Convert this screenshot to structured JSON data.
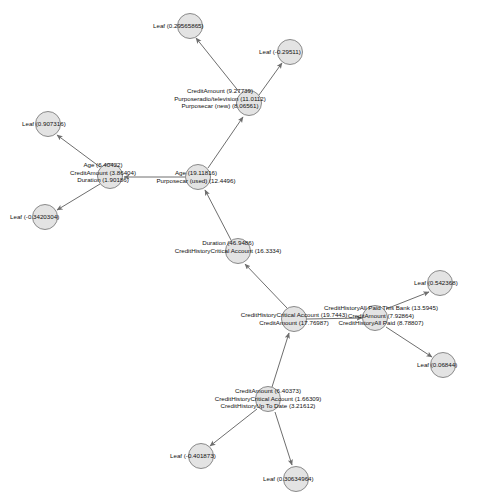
{
  "graph": {
    "type": "decision-tree-graph",
    "background_color": "#ffffff",
    "node_fill_color": "#e3e3e3",
    "node_stroke_color": "#8a8a8a",
    "edge_color": "#6e6e6e",
    "nodes": [
      {
        "id": "leaf_top_left",
        "kind": "leaf",
        "cx": 190,
        "cy": 26,
        "r": 13,
        "label_lines": [
          "Leaf (0.29565865)"
        ],
        "label_anchor": "left",
        "label_x": 153,
        "label_y": 22
      },
      {
        "id": "leaf_top_right",
        "kind": "leaf",
        "cx": 290,
        "cy": 52,
        "r": 13,
        "label_lines": [
          "Leaf (-0.29511)"
        ],
        "label_anchor": "left",
        "label_x": 259,
        "label_y": 48
      },
      {
        "id": "split_credit_amount_927",
        "kind": "split",
        "cx": 249,
        "cy": 103,
        "r": 13,
        "label_lines": [
          "CreditAmount (9.27739)",
          "Purposeradio/television (11.0112)",
          "Purposecar (new) (8.06561)"
        ],
        "label_anchor": "center",
        "label_x": 220,
        "label_y": 87
      },
      {
        "id": "leaf_left_upper",
        "kind": "leaf",
        "cx": 48,
        "cy": 124,
        "r": 13,
        "label_lines": [
          "Leaf (0.907316)"
        ],
        "label_anchor": "left",
        "label_x": 22,
        "label_y": 120
      },
      {
        "id": "split_age_640",
        "kind": "split",
        "cx": 110,
        "cy": 176,
        "r": 13,
        "label_lines": [
          "Age (6.40422)",
          "CreditAmount (3.86404)",
          "Duration (1.90186)"
        ],
        "label_anchor": "center",
        "label_x": 103,
        "label_y": 161
      },
      {
        "id": "split_age_1911",
        "kind": "split",
        "cx": 198,
        "cy": 177,
        "r": 13,
        "label_lines": [
          "Age (19.11816)",
          "Purposecar (used) (12.4496)"
        ],
        "label_anchor": "center",
        "label_x": 196,
        "label_y": 169
      },
      {
        "id": "leaf_left_lower",
        "kind": "leaf",
        "cx": 45,
        "cy": 217,
        "r": 13,
        "label_lines": [
          "Leaf (-0.3420304)"
        ],
        "label_anchor": "left",
        "label_x": 10,
        "label_y": 213
      },
      {
        "id": "split_duration_469",
        "kind": "split",
        "cx": 238,
        "cy": 251,
        "r": 13,
        "label_lines": [
          "Duration (46.9486)",
          "CreditHistoryCritical Account (16.3334)"
        ],
        "label_anchor": "center",
        "label_x": 228,
        "label_y": 239
      },
      {
        "id": "leaf_right_upper",
        "kind": "leaf",
        "cx": 440,
        "cy": 283,
        "r": 13,
        "label_lines": [
          "Leaf (0.542368)"
        ],
        "label_anchor": "left",
        "label_x": 414,
        "label_y": 279
      },
      {
        "id": "split_credit_history_1974",
        "kind": "split",
        "cx": 294,
        "cy": 319,
        "r": 13,
        "label_lines": [
          "CreditHistoryCritical Account (19.7443)",
          "CreditAmount (17.76987)"
        ],
        "label_anchor": "center",
        "label_x": 294,
        "label_y": 311
      },
      {
        "id": "split_credit_history_all_paid",
        "kind": "split",
        "cx": 375,
        "cy": 318,
        "r": 13,
        "label_lines": [
          "CreditHistoryAll Paid This Bank (13.5945)",
          "CreditAmount (7.92864)",
          "CreditHistoryAll Paid (8.78807)"
        ],
        "label_anchor": "center",
        "label_x": 381,
        "label_y": 304
      },
      {
        "id": "leaf_right_lower",
        "kind": "leaf",
        "cx": 443,
        "cy": 365,
        "r": 13,
        "label_lines": [
          "Leaf (0.06844)"
        ],
        "label_anchor": "left",
        "label_x": 417,
        "label_y": 361
      },
      {
        "id": "split_credit_amount_640",
        "kind": "split",
        "cx": 268,
        "cy": 399,
        "r": 13,
        "label_lines": [
          "CreditAmount (6.40373)",
          "CreditHistoryCritical Account (1.66309)",
          "CreditHistoryUp To Date (3.21612)"
        ],
        "label_anchor": "center",
        "label_x": 268,
        "label_y": 387
      },
      {
        "id": "leaf_bottom_left",
        "kind": "leaf",
        "cx": 201,
        "cy": 456,
        "r": 13,
        "label_lines": [
          "Leaf (-0.401873)"
        ],
        "label_anchor": "left",
        "label_x": 170,
        "label_y": 452
      },
      {
        "id": "leaf_bottom_right",
        "kind": "leaf",
        "cx": 296,
        "cy": 479,
        "r": 13,
        "label_lines": [
          "Leaf (0.30634964)"
        ],
        "label_anchor": "left",
        "label_x": 263,
        "label_y": 475
      }
    ],
    "edges": [
      {
        "id": "edge-split927-to-leaftopleft",
        "from": "split_credit_amount_927",
        "to": "leaf_top_left",
        "x1": 240,
        "y1": 93,
        "x2": 196,
        "y2": 38
      },
      {
        "id": "edge-split927-to-leaftopright",
        "from": "split_credit_amount_927",
        "to": "leaf_top_right",
        "x1": 259,
        "y1": 95,
        "x2": 282,
        "y2": 63
      },
      {
        "id": "edge-split1911-to-split927",
        "from": "split_age_1911",
        "to": "split_credit_amount_927",
        "x1": 208,
        "y1": 168,
        "x2": 243,
        "y2": 117
      },
      {
        "id": "edge-split640-to-leafleftupper",
        "from": "split_age_640",
        "to": "leaf_left_upper",
        "x1": 100,
        "y1": 167,
        "x2": 57,
        "y2": 135
      },
      {
        "id": "edge-split640-to-leafleftlower",
        "from": "split_age_640",
        "to": "leaf_left_lower",
        "x1": 100,
        "y1": 184,
        "x2": 57,
        "y2": 210
      },
      {
        "id": "edge-split1911-to-split640",
        "from": "split_age_1911",
        "to": "split_age_640",
        "x1": 185,
        "y1": 177,
        "x2": 124,
        "y2": 177
      },
      {
        "id": "edge-splitduration-to-split1911",
        "from": "split_duration_469",
        "to": "split_age_1911",
        "x1": 231,
        "y1": 240,
        "x2": 205,
        "y2": 190
      },
      {
        "id": "edge-splitch1974-to-splitduration",
        "from": "split_credit_history_1974",
        "to": "split_duration_469",
        "x1": 287,
        "y1": 308,
        "x2": 245,
        "y2": 264
      },
      {
        "id": "edge-splitallpaid-to-leafrightupper",
        "from": "split_credit_history_all_paid",
        "to": "leaf_right_upper",
        "x1": 386,
        "y1": 309,
        "x2": 429,
        "y2": 292
      },
      {
        "id": "edge-splitallpaid-to-leafrightlower",
        "from": "split_credit_history_all_paid",
        "to": "leaf_right_lower",
        "x1": 386,
        "y1": 327,
        "x2": 432,
        "y2": 357
      },
      {
        "id": "edge-splitch1974-to-splitallpaid",
        "from": "split_credit_history_1974",
        "to": "split_credit_history_all_paid",
        "x1": 307,
        "y1": 319,
        "x2": 362,
        "y2": 318
      },
      {
        "id": "edge-splitca640-to-splitch1974",
        "from": "split_credit_amount_640",
        "to": "split_credit_history_1974",
        "x1": 272,
        "y1": 387,
        "x2": 289,
        "y2": 333
      },
      {
        "id": "edge-splitca640-to-leafbottomleft",
        "from": "split_credit_amount_640",
        "to": "leaf_bottom_left",
        "x1": 257,
        "y1": 409,
        "x2": 210,
        "y2": 446
      },
      {
        "id": "edge-splitca640-to-leafbottomright",
        "from": "split_credit_amount_640",
        "to": "leaf_bottom_right",
        "x1": 275,
        "y1": 412,
        "x2": 292,
        "y2": 465
      }
    ]
  }
}
